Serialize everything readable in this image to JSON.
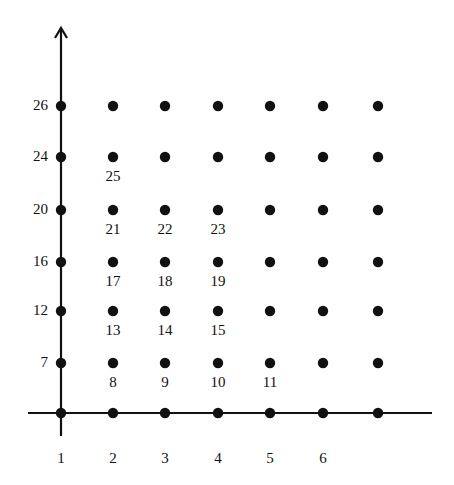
{
  "diagram": {
    "type": "lattice-point-grid",
    "colors": {
      "ink": "#111111",
      "background": "#ffffff"
    },
    "x_axis": {
      "tick_labels": [
        "1",
        "2",
        "3",
        "4",
        "5",
        "6",
        ""
      ],
      "pixel_x": [
        61,
        113,
        165,
        218,
        270,
        323,
        378
      ]
    },
    "y_axis": {
      "tick_labels": [
        "7",
        "12",
        "16",
        "20",
        "24",
        "26"
      ],
      "pixel_y": [
        363,
        311,
        262,
        210,
        157,
        106
      ]
    },
    "axis_baseline_y": 413,
    "point_labels": [
      {
        "text": "8",
        "col": 1,
        "row": 0
      },
      {
        "text": "9",
        "col": 2,
        "row": 0
      },
      {
        "text": "10",
        "col": 3,
        "row": 0
      },
      {
        "text": "11",
        "col": 4,
        "row": 0
      },
      {
        "text": "13",
        "col": 1,
        "row": 1
      },
      {
        "text": "14",
        "col": 2,
        "row": 1
      },
      {
        "text": "15",
        "col": 3,
        "row": 1
      },
      {
        "text": "17",
        "col": 1,
        "row": 2
      },
      {
        "text": "18",
        "col": 2,
        "row": 2
      },
      {
        "text": "19",
        "col": 3,
        "row": 2
      },
      {
        "text": "21",
        "col": 1,
        "row": 3
      },
      {
        "text": "22",
        "col": 2,
        "row": 3
      },
      {
        "text": "23",
        "col": 3,
        "row": 3
      },
      {
        "text": "25",
        "col": 1,
        "row": 4
      }
    ]
  }
}
